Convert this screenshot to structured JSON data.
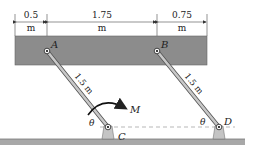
{
  "figure": {
    "dimensions": [
      {
        "value": "0.5",
        "unit": "m"
      },
      {
        "value": "1.75",
        "unit": "m"
      },
      {
        "value": "0.75",
        "unit": "m"
      }
    ],
    "points": {
      "A": "A",
      "B": "B",
      "C": "C",
      "D": "D"
    },
    "link_lengths": {
      "AC": "1.5 m",
      "BD": "1.5 m"
    },
    "angle_label": "θ",
    "moment_label": "M",
    "colors": {
      "bar": "#8c8c8c",
      "link": "#b5b5b5",
      "ground": "#9a9a9a",
      "support": "#c4c4c4",
      "ink": "#222222"
    }
  }
}
